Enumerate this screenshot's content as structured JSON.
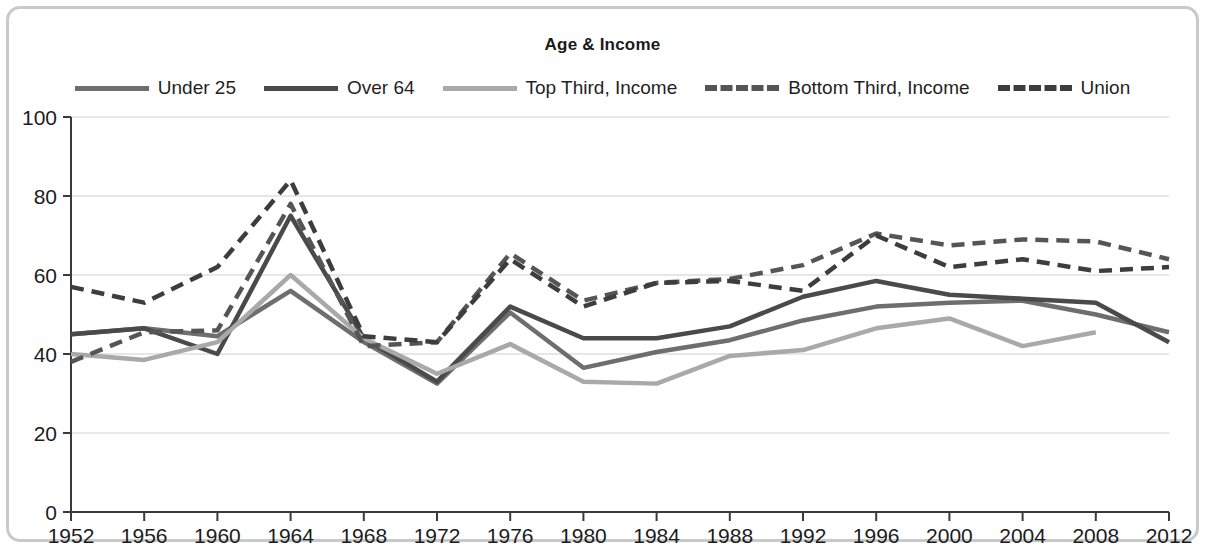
{
  "chart_data": {
    "type": "line",
    "title": "Age & Income",
    "xlabel": "",
    "ylabel": "",
    "x": [
      1952,
      1956,
      1960,
      1964,
      1968,
      1972,
      1976,
      1980,
      1984,
      1988,
      1992,
      1996,
      2000,
      2004,
      2008,
      2012
    ],
    "xtick_labels": [
      "1952",
      "1956",
      "1960",
      "1964",
      "1968",
      "1972",
      "1976",
      "1980",
      "1984",
      "1988",
      "1992",
      "1996",
      "2000",
      "2004",
      "2008",
      "2012"
    ],
    "ytick_labels": [
      "0",
      "20",
      "40",
      "60",
      "80",
      "100"
    ],
    "yticks": [
      0,
      20,
      40,
      60,
      80,
      100
    ],
    "ylim": [
      0,
      100
    ],
    "grid": true,
    "legend_position": "top",
    "series": [
      {
        "name": "Under 25",
        "color": "#6e6e6e",
        "style": "solid",
        "values": [
          45,
          46.5,
          44.5,
          56,
          43,
          32.5,
          50.5,
          36.5,
          40.5,
          43.5,
          48.5,
          52,
          53,
          53.5,
          50,
          45.5
        ]
      },
      {
        "name": "Over 64",
        "color": "#4a4a4a",
        "style": "solid",
        "values": [
          45,
          46.5,
          40,
          75,
          44,
          33,
          52,
          44,
          44,
          47,
          54.5,
          58.5,
          55,
          54,
          53,
          43
        ]
      },
      {
        "name": "Top Third, Income",
        "color": "#a9a9a9",
        "style": "solid",
        "values": [
          40,
          38.5,
          43,
          60,
          44,
          35,
          42.5,
          33,
          32.5,
          39.5,
          41,
          46.5,
          49,
          42,
          45.5,
          null
        ]
      },
      {
        "name": "Bottom Third, Income",
        "color": "#555555",
        "style": "dashed",
        "values": [
          38,
          45.5,
          46,
          78,
          42,
          43,
          65.5,
          53.5,
          58,
          59,
          62.5,
          70.5,
          67.5,
          69,
          68.5,
          64
        ]
      },
      {
        "name": "Union",
        "color": "#3d3d3d",
        "style": "dashed",
        "values": [
          57,
          53,
          62,
          84,
          44.5,
          43,
          64,
          52,
          58,
          58.5,
          56,
          70,
          62,
          64,
          61,
          62
        ]
      }
    ]
  }
}
